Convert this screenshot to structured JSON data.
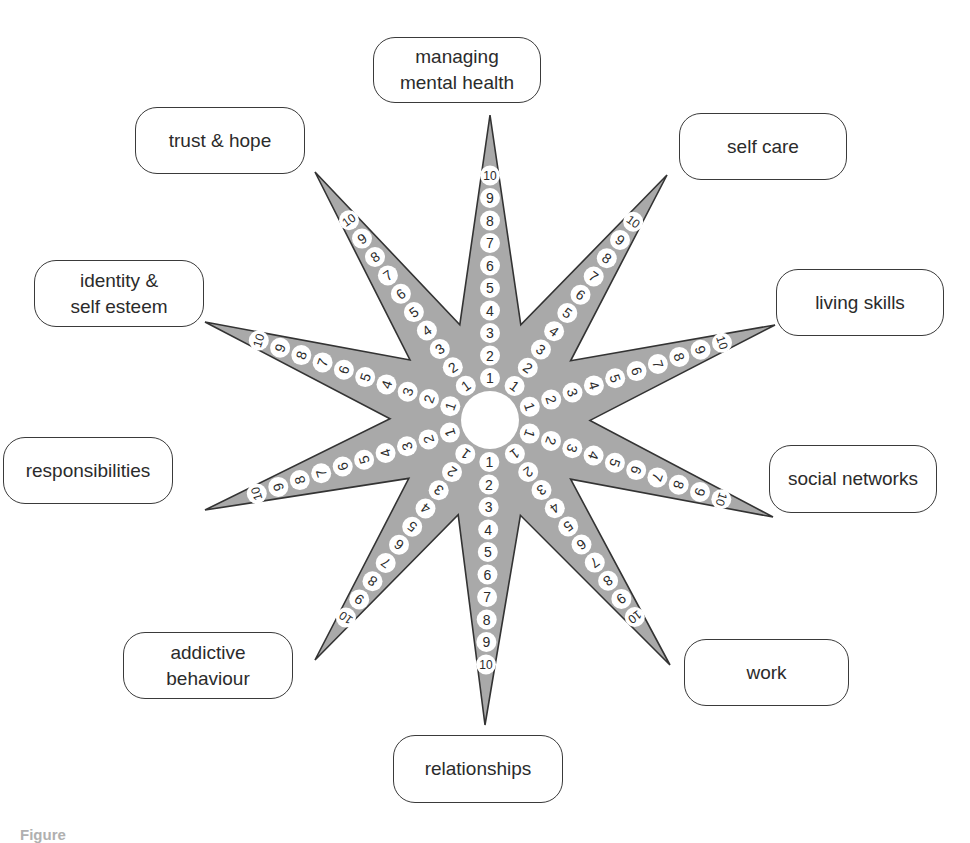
{
  "diagram": {
    "type": "outcomes-star",
    "center": {
      "x": 490,
      "y": 420,
      "radius": 29
    },
    "colors": {
      "star_fill": "#a9a9a9",
      "star_stroke": "#333333",
      "dot_fill": "#ffffff",
      "text": "#2b2b2b"
    },
    "scale": [
      "1",
      "2",
      "3",
      "4",
      "5",
      "6",
      "7",
      "8",
      "9",
      "10"
    ],
    "arms": [
      {
        "name": "managing mental health",
        "label": "managing\nmental health",
        "tip": [
          490,
          115
        ],
        "box": {
          "x": 373,
          "y": 37,
          "w": 168,
          "h": 66
        }
      },
      {
        "name": "self care",
        "label": "self care",
        "tip": [
          667,
          175
        ],
        "box": {
          "x": 679,
          "y": 113,
          "w": 168,
          "h": 67
        }
      },
      {
        "name": "living skills",
        "label": "living skills",
        "tip": [
          775,
          325
        ],
        "box": {
          "x": 776,
          "y": 269,
          "w": 168,
          "h": 67
        }
      },
      {
        "name": "social networks",
        "label": "social networks",
        "tip": [
          773,
          517
        ],
        "box": {
          "x": 769,
          "y": 445,
          "w": 168,
          "h": 68
        }
      },
      {
        "name": "work",
        "label": "work",
        "tip": [
          670,
          665
        ],
        "box": {
          "x": 684,
          "y": 639,
          "w": 165,
          "h": 67
        }
      },
      {
        "name": "relationships",
        "label": "relationships",
        "tip": [
          485,
          725
        ],
        "box": {
          "x": 393,
          "y": 735,
          "w": 170,
          "h": 68
        }
      },
      {
        "name": "addictive behaviour",
        "label": "addictive\nbehaviour",
        "tip": [
          315,
          660
        ],
        "box": {
          "x": 123,
          "y": 632,
          "w": 170,
          "h": 67
        }
      },
      {
        "name": "responsibilities",
        "label": "responsibilities",
        "tip": [
          205,
          510
        ],
        "box": {
          "x": 3,
          "y": 437,
          "w": 170,
          "h": 67
        }
      },
      {
        "name": "identity & self esteem",
        "label": "identity &\nself esteem",
        "tip": [
          205,
          322
        ],
        "box": {
          "x": 34,
          "y": 260,
          "w": 170,
          "h": 67
        }
      },
      {
        "name": "trust & hope",
        "label": "trust & hope",
        "tip": [
          315,
          172
        ],
        "box": {
          "x": 135,
          "y": 107,
          "w": 170,
          "h": 67
        }
      }
    ],
    "valleys": [
      [
        533,
        287
      ],
      [
        600,
        337
      ],
      [
        598,
        505
      ],
      [
        530,
        555
      ],
      [
        445,
        555
      ],
      [
        375,
        503
      ],
      [
        375,
        335
      ],
      [
        447,
        287
      ]
    ]
  },
  "caption": {
    "text": "Figure"
  }
}
